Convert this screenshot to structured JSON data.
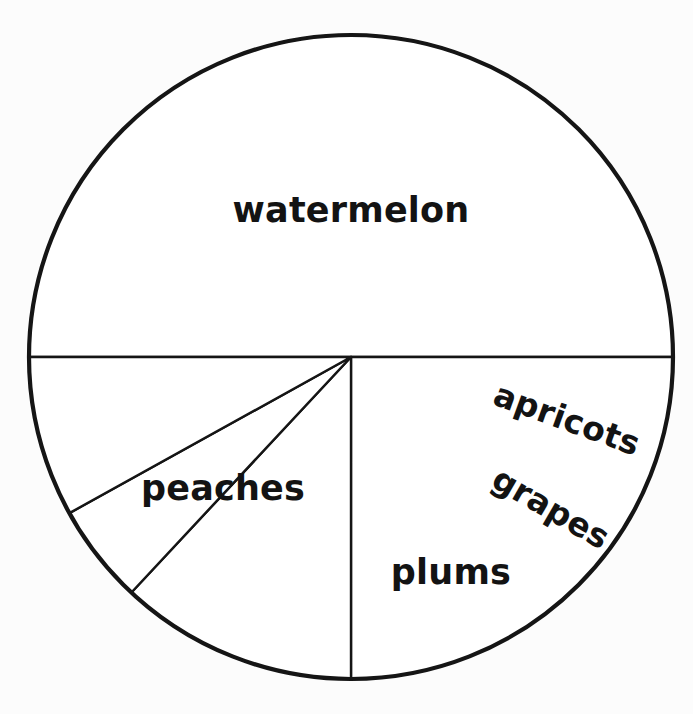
{
  "chart_data": {
    "type": "pie",
    "title": "",
    "subtitle": "",
    "xlabel": "",
    "ylabel": "",
    "legend": "none",
    "grid": false,
    "style": "hand-drawn black outline on white, no fill colors",
    "center": {
      "x": 351,
      "y": 357
    },
    "radius": 322,
    "start_angle_deg": 180,
    "direction": "clockwise",
    "categories": [
      "watermelon",
      "peaches",
      "plums",
      "grapes",
      "apricots"
    ],
    "values": [
      50,
      25,
      12,
      5,
      8
    ],
    "units": "percent",
    "slices": [
      {
        "label": "watermelon",
        "value": 50,
        "start_angle_deg": 180,
        "end_angle_deg": 360,
        "sweep_deg": 180,
        "label_x": 351,
        "label_y": 210,
        "label_rotation_deg": 0
      },
      {
        "label": "peaches",
        "value": 25,
        "start_angle_deg": 0,
        "end_angle_deg": 90,
        "sweep_deg": 90,
        "label_x": 223,
        "label_y": 488,
        "label_rotation_deg": 0
      },
      {
        "label": "plums",
        "value": 12,
        "start_angle_deg": 90,
        "end_angle_deg": 133,
        "sweep_deg": 43,
        "label_x": 451,
        "label_y": 572,
        "label_rotation_deg": 0
      },
      {
        "label": "grapes",
        "value": 5,
        "start_angle_deg": 133,
        "end_angle_deg": 151,
        "sweep_deg": 18,
        "label_x": 551,
        "label_y": 508,
        "label_rotation_deg": 30
      },
      {
        "label": "apricots",
        "value": 8,
        "start_angle_deg": 151,
        "end_angle_deg": 180,
        "sweep_deg": 29,
        "label_x": 567,
        "label_y": 419,
        "label_rotation_deg": 20
      }
    ],
    "colors": {
      "background": "#fcfcfc",
      "outline": "#151515",
      "slice_fill": "#ffffff",
      "label_text": "#131313"
    }
  }
}
